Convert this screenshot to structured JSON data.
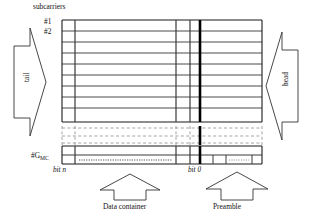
{
  "figure": {
    "type": "ofdm-frame-structure-diagram"
  },
  "labels": {
    "subcarriers": "subcarriers",
    "row_first": "#1",
    "row_second": "#2",
    "row_last_prefix": "#G",
    "row_last_subscript": "MC",
    "bit_n": "bit n",
    "bit_0": "bit 0",
    "tail": "tail",
    "head": "head",
    "data_container": "Data container",
    "preamble": "Preamble"
  },
  "geometry": {
    "grid_left": 62,
    "grid_right": 262,
    "grid_top": 20,
    "grid_block_bottom": 122,
    "ellipsis_top": 127,
    "ellipsis_bottom": 143,
    "last_row_top": 146,
    "last_row_bottom": 164,
    "inner_vline": 75,
    "sep_vline_a": 176,
    "sep_vline_b": 190,
    "thick_vline": 200,
    "row_count": 9
  },
  "colors": {
    "line": "#1a1a1a",
    "line_soft": "#555555",
    "dashed": "#9a9a9a",
    "background": "#ffffff",
    "thick": "#000000"
  }
}
